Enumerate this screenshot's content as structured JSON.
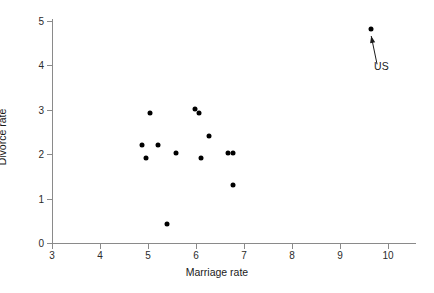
{
  "chart_data": {
    "type": "scatter",
    "title": "",
    "xlabel": "Marriage rate",
    "ylabel": "Divorce rate",
    "xlim": [
      3,
      10
    ],
    "ylim": [
      0,
      5
    ],
    "xticks": [
      3,
      4,
      5,
      6,
      7,
      8,
      9,
      10
    ],
    "xtick_labels": [
      "3",
      "4",
      "5",
      "6",
      "7",
      "8",
      "9",
      "10"
    ],
    "yticks": [
      0,
      1,
      2,
      3,
      4,
      5
    ],
    "ytick_labels": [
      "0",
      "1",
      "2",
      "3",
      "4",
      "5"
    ],
    "grid": false,
    "legend": null,
    "marker": "filled-circle",
    "marker_color": "#000000",
    "points": [
      {
        "x": 4.88,
        "y": 2.2
      },
      {
        "x": 4.95,
        "y": 1.91
      },
      {
        "x": 5.05,
        "y": 2.92
      },
      {
        "x": 5.2,
        "y": 2.2
      },
      {
        "x": 5.4,
        "y": 0.43
      },
      {
        "x": 5.58,
        "y": 2.02
      },
      {
        "x": 5.98,
        "y": 3.02
      },
      {
        "x": 6.07,
        "y": 2.92
      },
      {
        "x": 6.1,
        "y": 1.91
      },
      {
        "x": 6.28,
        "y": 2.41
      },
      {
        "x": 6.67,
        "y": 2.03
      },
      {
        "x": 6.77,
        "y": 2.03
      },
      {
        "x": 6.78,
        "y": 1.31
      },
      {
        "x": 9.65,
        "y": 4.82
      }
    ],
    "annotations": [
      {
        "text": "US",
        "point_x": 9.65,
        "point_y": 4.82,
        "label_x": 9.71,
        "label_y": 3.98
      }
    ]
  }
}
